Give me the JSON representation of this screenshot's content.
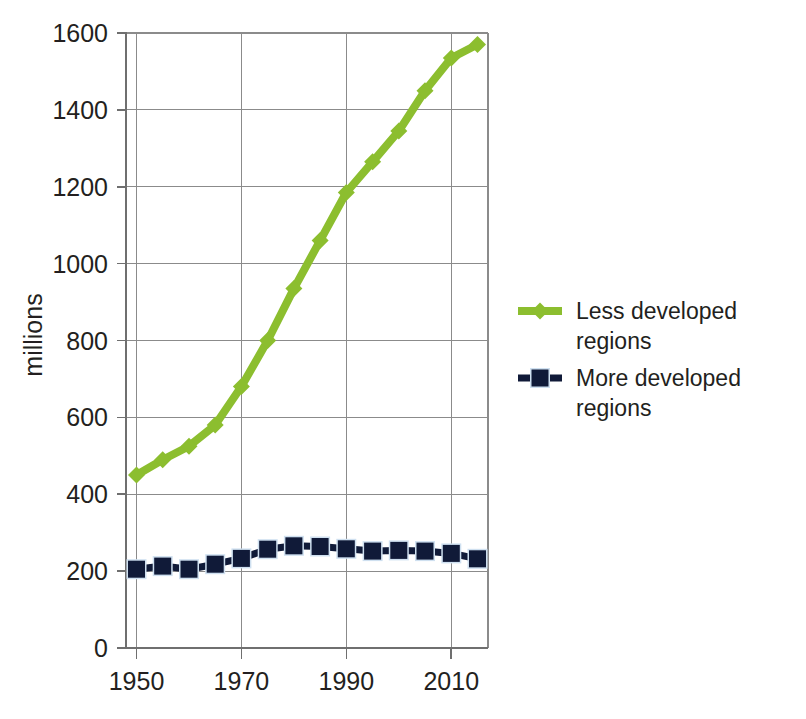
{
  "chart_data": {
    "type": "line",
    "title": "",
    "xlabel": "",
    "ylabel": "millions",
    "x": [
      1950,
      1955,
      1960,
      1965,
      1970,
      1975,
      1980,
      1985,
      1990,
      1995,
      2000,
      2005,
      2010,
      2015
    ],
    "xlim": [
      1948,
      2017
    ],
    "ylim": [
      0,
      1600
    ],
    "xticks": [
      1950,
      1970,
      1990,
      2010
    ],
    "xtick_labels": [
      "1950",
      "1970",
      "1990",
      "2010"
    ],
    "yticks": [
      0,
      200,
      400,
      600,
      800,
      1000,
      1200,
      1400,
      1600
    ],
    "ytick_labels": [
      "0",
      "200",
      "400",
      "600",
      "800",
      "1000",
      "1200",
      "1400",
      "1600"
    ],
    "grid": true,
    "legend_position": "right",
    "series": [
      {
        "name": "Less developed regions",
        "color": "#8CBE2F",
        "marker": "diamond",
        "values": [
          450,
          490,
          525,
          580,
          680,
          800,
          935,
          1060,
          1185,
          1265,
          1345,
          1450,
          1535,
          1570
        ]
      },
      {
        "name": "More developed regions",
        "color": "#101A38",
        "marker": "square",
        "values": [
          205,
          213,
          205,
          218,
          233,
          257,
          266,
          264,
          258,
          252,
          254,
          252,
          246,
          232
        ]
      }
    ]
  },
  "legend": {
    "items": [
      {
        "label": "Less developed regions",
        "color": "#8CBE2F",
        "marker": "diamond"
      },
      {
        "label": "More developed regions",
        "color": "#101A38",
        "marker": "square"
      }
    ]
  },
  "axes": {
    "y_axis_title": "millions"
  }
}
